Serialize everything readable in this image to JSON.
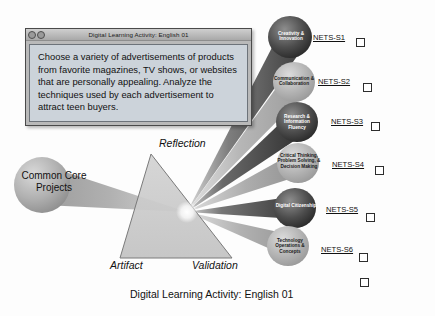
{
  "dialog": {
    "title": "Digital Learning Activity: English 01",
    "body": "Choose a variety of advertisements of products from favorite magazines, TV shows, or websites that are personally appealing. Analyze the techniques used by each advertisement to attract teen buyers.",
    "controls": [
      {
        "name": "close-button",
        "glyph": ""
      },
      {
        "name": "minimize-button",
        "glyph": ""
      }
    ]
  },
  "caption": "Digital Learning Activity: English 01",
  "prism": {
    "input_bubble": "Common Core Projects",
    "vertex_labels": {
      "top": "Reflection",
      "bottom_left": "Artifact",
      "bottom_right": "Validation"
    }
  },
  "spokes": [
    {
      "id": "nets-s1",
      "name": "Creativity & Innovation",
      "code": "NETS-S1",
      "tone": "dark"
    },
    {
      "id": "nets-s2",
      "name": "Communication & Collaboration",
      "code": "NETS-S2",
      "tone": "light"
    },
    {
      "id": "nets-s3",
      "name": "Research & Information Fluency",
      "code": "NETS-S3",
      "tone": "dark"
    },
    {
      "id": "nets-s4",
      "name": "Critical Thinking, Problem Solving, & Decision Making",
      "code": "NETS-S4",
      "tone": "light"
    },
    {
      "id": "nets-s5",
      "name": "Digital Citizenship",
      "code": "NETS-S5",
      "tone": "dark"
    },
    {
      "id": "nets-s6",
      "name": "Technology Operations & Concepts",
      "code": "NETS-S6",
      "tone": "light"
    }
  ],
  "colors": {
    "page_background": "#fdfdfd",
    "dialog_frame": "#b9b9b9",
    "dialog_body": "#ccd3da",
    "prism_fill": "#c9c9c9",
    "ray_dark": "#4a4a4a",
    "ray_light": "#a9a9a9",
    "checkbox_fill": "#ffffff",
    "text": "#111111"
  },
  "checkbox_count": 7
}
